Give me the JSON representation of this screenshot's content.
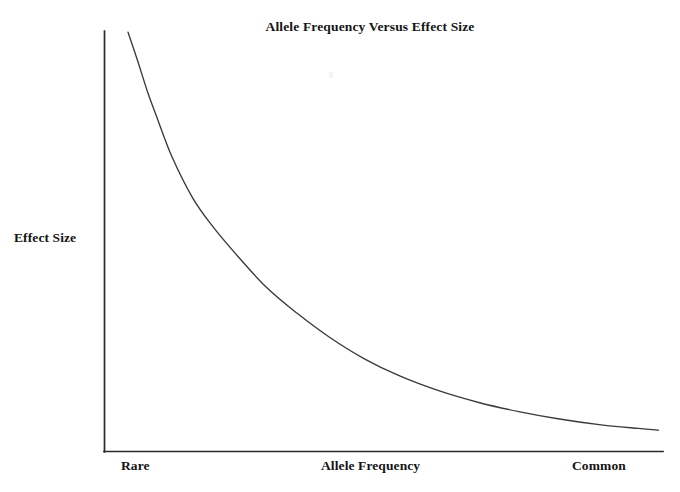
{
  "chart_data": {
    "type": "line",
    "title": "Allele Frequency Versus Effect Size",
    "xlabel": "Allele Frequency",
    "ylabel": "Effect Size",
    "grid": false,
    "legend": "none",
    "x_tick_labels": [
      "Rare",
      "Common"
    ],
    "y_tick_labels": [],
    "xlim": [
      0,
      1
    ],
    "ylim": [
      0,
      1
    ],
    "annotations": [],
    "series": [
      {
        "name": "Effect Size vs Allele Frequency",
        "color": "#3a3a3a",
        "description": "Monotonically decreasing hyperbolic decay: rare alleles have large effect sizes, common alleles have small effect sizes",
        "x": [
          0.043,
          0.06,
          0.078,
          0.096,
          0.122,
          0.158,
          0.192,
          0.236,
          0.29,
          0.345,
          0.404,
          0.465,
          0.53,
          0.6,
          0.672,
          0.742,
          0.812,
          0.886,
          0.956,
          0.992
        ],
        "y": [
          0.997,
          0.93,
          0.855,
          0.79,
          0.7,
          0.605,
          0.54,
          0.47,
          0.392,
          0.33,
          0.272,
          0.222,
          0.18,
          0.145,
          0.117,
          0.096,
          0.079,
          0.065,
          0.056,
          0.052
        ]
      }
    ]
  },
  "figure": {
    "title": "Allele Frequency Versus Effect Size",
    "y_axis_label": "Effect Size",
    "x_axis_label": "Allele Frequency",
    "x_axis_low_label": "Rare",
    "x_axis_high_label": "Common",
    "axis_color": "#2a2a2a",
    "curve_color": "#3a3a3a",
    "background_color": "#ffffff"
  }
}
